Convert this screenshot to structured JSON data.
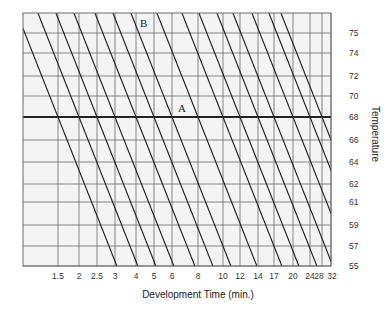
{
  "chart_data": {
    "type": "line",
    "title": "",
    "xlabel": "Development Time (min.)",
    "ylabel": "Temperature",
    "x_scale": "log",
    "x_ticks": [
      "1.5",
      "2",
      "2.5",
      "3",
      "4",
      "5",
      "6",
      "8",
      "10",
      "12",
      "14",
      "17",
      "20",
      "24",
      "28",
      "32"
    ],
    "y_ticks": [
      "75",
      "74",
      "72",
      "70",
      "68",
      "66",
      "64",
      "62",
      "61",
      "59",
      "57",
      "55"
    ],
    "ylim": [
      55,
      75
    ],
    "grid": true,
    "reference_line": {
      "temperature": 68,
      "label": "A"
    },
    "annotations": [
      {
        "text": "A",
        "near": "68°F reference line, ~8 min"
      },
      {
        "text": "B",
        "near": "top of chart, ~6 min"
      }
    ],
    "series_description": "Family of parallel time-temperature compensation lines; each line crosses 68°F at the labeled development time",
    "series": [
      {
        "name": "1.5 min @68",
        "time_at_68": 1.5
      },
      {
        "name": "2 min @68",
        "time_at_68": 2
      },
      {
        "name": "2.5 min @68",
        "time_at_68": 2.5
      },
      {
        "name": "3 min @68",
        "time_at_68": 3
      },
      {
        "name": "4 min @68",
        "time_at_68": 4
      },
      {
        "name": "5 min @68",
        "time_at_68": 5
      },
      {
        "name": "6 min @68",
        "time_at_68": 6
      },
      {
        "name": "8 min @68",
        "time_at_68": 8
      },
      {
        "name": "10 min @68",
        "time_at_68": 10
      },
      {
        "name": "12 min @68",
        "time_at_68": 12
      },
      {
        "name": "14 min @68",
        "time_at_68": 14
      },
      {
        "name": "17 min @68",
        "time_at_68": 17
      },
      {
        "name": "20 min @68",
        "time_at_68": 20
      },
      {
        "name": "24 min @68",
        "time_at_68": 24
      },
      {
        "name": "28 min @68",
        "time_at_68": 28
      }
    ]
  },
  "layout": {
    "plot": {
      "left": 23,
      "top": 13,
      "right": 331,
      "bottom": 266
    },
    "x_positions": [
      58,
      79,
      97,
      115,
      136,
      154,
      172,
      198,
      223,
      240,
      258,
      274,
      293,
      310,
      322,
      331
    ],
    "y_positions": [
      33,
      53,
      76,
      96,
      117,
      140,
      162,
      184,
      202,
      225,
      246,
      266
    ],
    "line_crossings_at_68": [
      58,
      79,
      97,
      115,
      136,
      154,
      172,
      198,
      223,
      240,
      258,
      274,
      293,
      310,
      322
    ],
    "slope_dx_per_dy": 0.395,
    "marker_a": {
      "x": 178,
      "y": 112
    },
    "marker_b": {
      "x": 140,
      "y": 27
    }
  },
  "colors": {
    "background": "#f4f4f4",
    "grid": "#6a6a6a",
    "line": "#1a1a1a",
    "ref": "#222222"
  }
}
